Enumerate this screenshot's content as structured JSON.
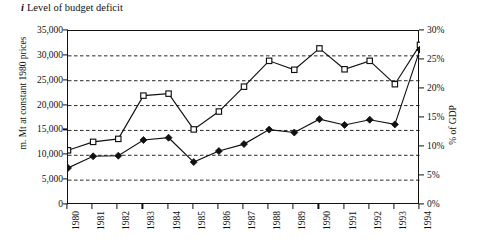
{
  "title": {
    "index": "i",
    "text": "Level of budget deficit"
  },
  "axes": {
    "left_label": "m. Mt at constant 1980 prices",
    "right_label": "% of GDP",
    "left_ticks": [
      "0",
      "5,000",
      "10,000",
      "15,000",
      "20,000",
      "25,000",
      "30,000",
      "35,000"
    ],
    "left_tick_values": [
      0,
      5000,
      10000,
      15000,
      20000,
      25000,
      30000,
      35000
    ],
    "right_ticks": [
      "0%",
      "5%",
      "10%",
      "15%",
      "20%",
      "25%",
      "30%"
    ],
    "right_tick_values": [
      0,
      5,
      10,
      15,
      20,
      25,
      30
    ],
    "x_ticks": [
      "1980",
      "1981",
      "1982",
      "1983",
      "1984",
      "1985",
      "1986",
      "1987",
      "1988",
      "1989",
      "1990",
      "1991",
      "1992",
      "1993",
      "1994"
    ]
  },
  "chart_data": {
    "type": "line",
    "xlabel": "",
    "ylabel": "m. Mt at constant 1980 prices",
    "y2label": "% of GDP",
    "x": [
      1980,
      1981,
      1982,
      1983,
      1984,
      1985,
      1986,
      1987,
      1988,
      1989,
      1990,
      1991,
      1992,
      1993,
      1994
    ],
    "ylim": [
      0,
      35000
    ],
    "y2lim": [
      0,
      30
    ],
    "grid": true,
    "grid_axis": "y",
    "legend": "none",
    "series": [
      {
        "name": "Level of budget deficit (m. Mt at constant 1980 prices)",
        "axis": "left",
        "marker": "open-square",
        "color": "#111111",
        "values": [
          11000,
          12700,
          13300,
          22000,
          22400,
          15200,
          18800,
          23800,
          29000,
          27200,
          31500,
          27300,
          29000,
          24300,
          32200
        ]
      },
      {
        "name": "Budget deficit as % of GDP",
        "axis": "right",
        "marker": "filled-diamond",
        "color": "#111111",
        "values": [
          6.4,
          8.4,
          8.5,
          11.2,
          11.6,
          7.4,
          9.3,
          10.5,
          13.0,
          12.5,
          14.8,
          13.8,
          14.7,
          13.9,
          26.8
        ]
      }
    ]
  }
}
